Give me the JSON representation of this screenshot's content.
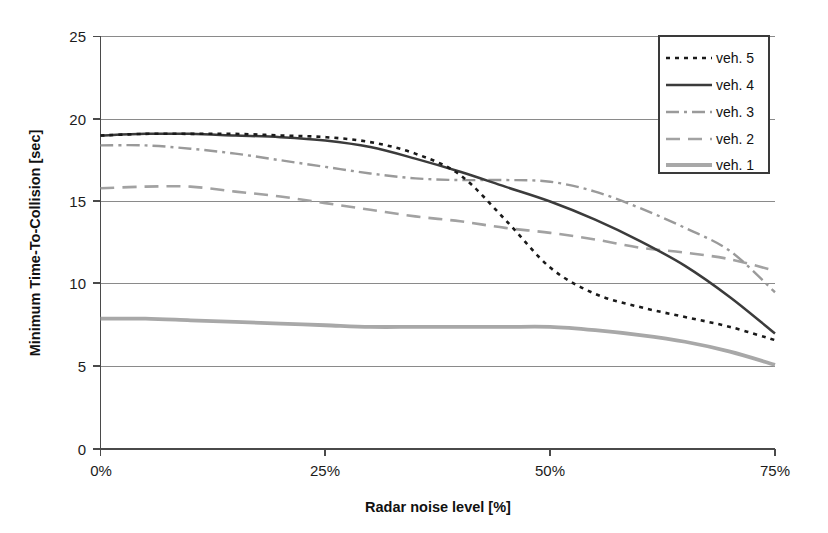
{
  "chart_data": {
    "type": "line",
    "title": "",
    "xlabel": "Radar noise level [%]",
    "ylabel": "Minimum Time-To-Collision [sec]",
    "xlim": [
      0,
      75
    ],
    "ylim": [
      0,
      25
    ],
    "xtick_labels": [
      "0%",
      "25%",
      "50%",
      "75%"
    ],
    "xtick_values": [
      0,
      25,
      50,
      75
    ],
    "ytick_labels": [
      "0",
      "5",
      "10",
      "15",
      "20",
      "25"
    ],
    "ytick_values": [
      0,
      5,
      10,
      15,
      20,
      25
    ],
    "grid": "horizontal",
    "legend_position": "top-right",
    "x": [
      0,
      5,
      10,
      15,
      20,
      25,
      30,
      35,
      40,
      45,
      50,
      55,
      60,
      65,
      70,
      75
    ],
    "series": [
      {
        "name": "veh. 5",
        "style": "dotted",
        "color": "#1a1a1a",
        "values": [
          19.0,
          19.1,
          19.1,
          19.1,
          19.0,
          18.9,
          18.6,
          17.9,
          16.6,
          13.9,
          11.0,
          9.4,
          8.6,
          8.0,
          7.4,
          6.6
        ]
      },
      {
        "name": "veh. 4",
        "style": "solid",
        "color": "#3b3b3b",
        "values": [
          19.0,
          19.1,
          19.1,
          19.0,
          18.9,
          18.7,
          18.3,
          17.6,
          16.8,
          15.9,
          15.0,
          13.9,
          12.6,
          11.1,
          9.2,
          7.0
        ]
      },
      {
        "name": "veh. 3",
        "style": "dash-dot",
        "color": "#9a9a9a",
        "values": [
          18.4,
          18.4,
          18.2,
          17.9,
          17.5,
          17.1,
          16.7,
          16.4,
          16.3,
          16.3,
          16.2,
          15.6,
          14.6,
          13.4,
          12.0,
          9.5
        ]
      },
      {
        "name": "veh. 2",
        "style": "dashed",
        "color": "#a2a2a2",
        "values": [
          15.8,
          15.9,
          15.9,
          15.6,
          15.3,
          14.9,
          14.5,
          14.1,
          13.8,
          13.4,
          13.1,
          12.7,
          12.2,
          11.9,
          11.5,
          10.8
        ]
      },
      {
        "name": "veh. 1",
        "style": "solid-thick",
        "color": "#a8a8a8",
        "values": [
          7.9,
          7.9,
          7.8,
          7.7,
          7.6,
          7.5,
          7.4,
          7.4,
          7.4,
          7.4,
          7.4,
          7.2,
          6.9,
          6.5,
          5.9,
          5.1
        ]
      }
    ]
  }
}
